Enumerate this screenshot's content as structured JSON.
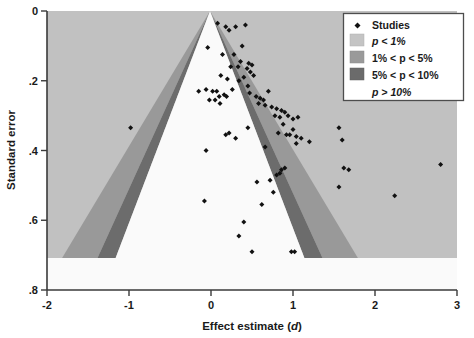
{
  "figure": {
    "title": "",
    "background": "#ffffff",
    "plot_background": "#b8b8b8"
  },
  "axes": {
    "x": {
      "label_main": "Effect estimate (",
      "label_italic": "d",
      "label_close": ")",
      "label_full": "Effect estimate (d)",
      "ticks": [
        "-2",
        "-1",
        "0",
        "1",
        "2",
        "3"
      ],
      "tick_values": [
        -2,
        -1,
        0,
        1,
        2,
        3
      ],
      "range": [
        -2,
        3
      ]
    },
    "y": {
      "label": "Standard error",
      "ticks": [
        "0",
        ".2",
        ".4",
        ".6",
        ".8"
      ],
      "tick_values": [
        0,
        0.2,
        0.4,
        0.6,
        0.8
      ],
      "range": [
        0,
        0.8
      ],
      "inverted": true
    }
  },
  "legend": {
    "position": "top-right",
    "border_color": "#4d4d4d",
    "background": "#ffffff",
    "items": [
      {
        "label": "Studies",
        "swatch": "marker",
        "color": "#111111"
      },
      {
        "label": "p < 1%",
        "swatch": "patch",
        "color": "#c4c4c4",
        "italic_lead": "p"
      },
      {
        "label": "1% < p < 5%",
        "swatch": "patch",
        "color": "#9a9a9a",
        "italic_lead": "p"
      },
      {
        "label": "5% < p < 10%",
        "swatch": "patch",
        "color": "#6b6b6b",
        "italic_lead": "p"
      },
      {
        "label": "p > 10%",
        "swatch": "none",
        "color": "#ffffff",
        "italic_lead": "p"
      }
    ]
  },
  "chart_data": {
    "type": "scatter",
    "title": "",
    "xlabel": "Effect estimate (d)",
    "ylabel": "Standard error",
    "xlim": [
      -2,
      3
    ],
    "ylim": [
      0,
      0.8
    ],
    "y_inverted": true,
    "grid": false,
    "legend_position": "top-right",
    "series": [
      {
        "name": "Studies",
        "marker": "diamond",
        "color": "#111111",
        "x": [
          0.08,
          0.18,
          0.3,
          0.42,
          -0.04,
          0.22,
          0.14,
          0.28,
          0.38,
          0.36,
          0.46,
          0.5,
          0.33,
          0.24,
          0.44,
          0.48,
          0.52,
          0.4,
          0.12,
          0.2,
          -0.15,
          -0.06,
          0.02,
          0.07,
          0.1,
          0.16,
          0.19,
          0.05,
          -0.02,
          0.11,
          0.26,
          0.34,
          0.45,
          0.47,
          0.55,
          0.6,
          0.64,
          0.7,
          0.58,
          0.66,
          0.74,
          0.8,
          0.86,
          0.9,
          0.78,
          0.84,
          0.94,
          1.0,
          1.06,
          0.88,
          0.82,
          0.92,
          0.96,
          1.04,
          1.1,
          1.2,
          0.9,
          0.86,
          0.84,
          0.8,
          1.56,
          1.6,
          1.62,
          1.68,
          1.56,
          2.24,
          2.8,
          1.0,
          1.04,
          0.22,
          0.3,
          0.45,
          0.66,
          -0.06,
          -0.98,
          -0.08,
          0.18,
          0.4,
          0.34,
          0.5,
          0.56,
          0.62,
          0.72,
          0.76,
          0.98,
          1.02
        ],
        "y": [
          0.035,
          0.045,
          0.045,
          0.04,
          0.105,
          0.055,
          0.125,
          0.125,
          0.1,
          0.145,
          0.15,
          0.155,
          0.16,
          0.16,
          0.165,
          0.175,
          0.185,
          0.19,
          0.185,
          0.195,
          0.23,
          0.225,
          0.23,
          0.23,
          0.245,
          0.24,
          0.245,
          0.255,
          0.255,
          0.265,
          0.225,
          0.2,
          0.215,
          0.235,
          0.245,
          0.25,
          0.255,
          0.23,
          0.265,
          0.27,
          0.275,
          0.28,
          0.285,
          0.29,
          0.3,
          0.305,
          0.3,
          0.31,
          0.305,
          0.325,
          0.35,
          0.355,
          0.355,
          0.36,
          0.365,
          0.375,
          0.45,
          0.455,
          0.465,
          0.47,
          0.335,
          0.37,
          0.45,
          0.455,
          0.505,
          0.53,
          0.44,
          0.34,
          0.38,
          0.35,
          0.365,
          0.335,
          0.39,
          0.4,
          0.335,
          0.545,
          0.355,
          0.605,
          0.645,
          0.69,
          0.49,
          0.555,
          0.485,
          0.52,
          0.69,
          0.69
        ],
        "count": 86
      }
    ],
    "contour_regions": [
      {
        "name": "p > 10%",
        "z_from": 0.0,
        "z_to": 1.645,
        "color": "#ffffff",
        "extent_se": 0.7
      },
      {
        "name": "5% < p < 10%",
        "z_from": 1.645,
        "z_to": 1.96,
        "color": "#6b6b6b",
        "extent_se": 0.7
      },
      {
        "name": "1% < p < 5%",
        "z_from": 1.96,
        "z_to": 2.576,
        "color": "#9a9a9a",
        "extent_se": 0.7
      },
      {
        "name": "p < 1%",
        "z_from": 2.576,
        "z_to": null,
        "color": "#c4c4c4",
        "extent_se": 0.7
      }
    ],
    "funnel_apex": {
      "d": 0,
      "se": 0
    },
    "annotations": []
  }
}
